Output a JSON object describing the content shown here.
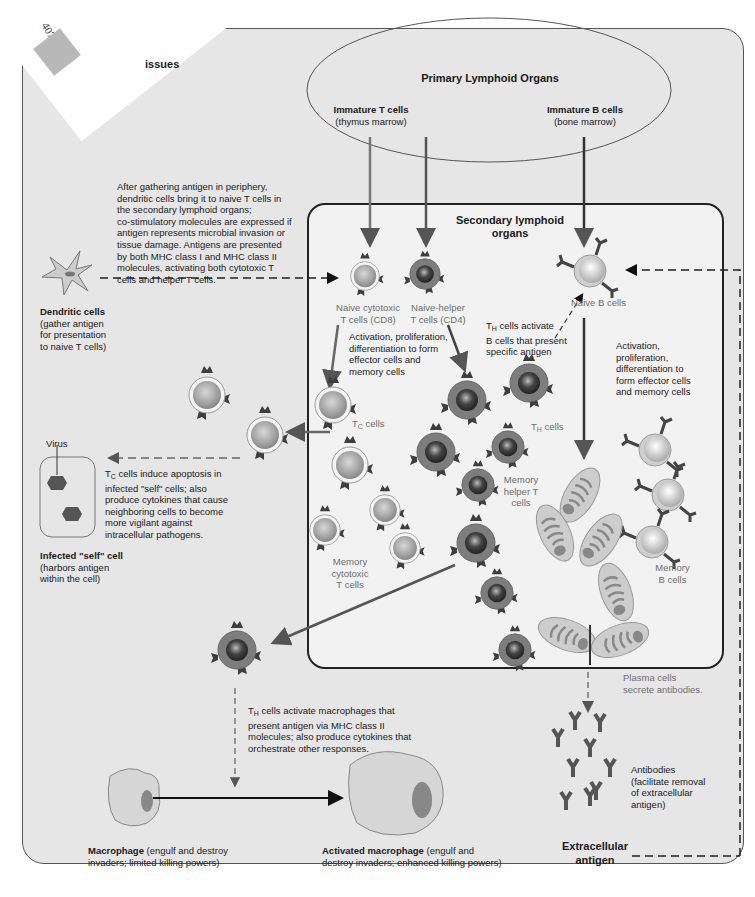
{
  "page": {
    "number": "407",
    "section_title_fragment": "issues"
  },
  "primary_organs": {
    "title": "Primary Lymphoid Organs",
    "immature_t": {
      "title": "Immature T cells",
      "subtitle": "(thymus marrow)"
    },
    "immature_b": {
      "title": "Immature B cells",
      "subtitle": "(bone marrow)"
    }
  },
  "secondary_organs": {
    "title_line1": "Secondary lymphoid",
    "title_line2": "organs"
  },
  "dendritic": {
    "title": "Dendritic cells",
    "desc": [
      "(gather antigen",
      "for presentation",
      "to naive T cells)"
    ],
    "note": [
      "After gathering antigen in periphery,",
      "dendritic cells bring it to naive T cells in",
      "the secondary lymphoid organs;",
      "co-stimulatory molecules are expressed if",
      "antigen represents microbial invasion or",
      "tissue damage. Antigens are presented",
      "by both MHC class I and MHC class II",
      "molecules, activating both cytotoxic T",
      "cells and helper T cells."
    ]
  },
  "naive": {
    "cytotoxic": [
      "Naive cytotoxic",
      "T cells (CD8)"
    ],
    "helper": [
      "Naive-helper",
      "T cells (CD4)"
    ],
    "b": "Naive B cells"
  },
  "activation_t": [
    "Activation, proliferation,",
    "differentiation to form",
    "effector cells and",
    "memory cells"
  ],
  "activation_b": [
    "Activation,",
    "proliferation,",
    "differentiation to",
    "form effector cells",
    "and memory cells"
  ],
  "th_activate_b": {
    "prefix": "T",
    "sub": "H",
    "lines": [
      " cells activate",
      "B cells that present",
      "specific antigen"
    ]
  },
  "tc_cells": {
    "prefix": "T",
    "sub": "C",
    "suffix": " cells"
  },
  "th_cells": {
    "prefix": "T",
    "sub": "H",
    "suffix": " cells"
  },
  "memory_helper": [
    "Memory",
    "helper T",
    "cells"
  ],
  "memory_cytotoxic": [
    "Memory",
    "cytotoxic",
    "T cells"
  ],
  "memory_b": [
    "Memory",
    "B cells"
  ],
  "infected": {
    "virus_label": "Virus",
    "title": "Infected \"self\" cell",
    "desc": [
      "(harbors antigen",
      "within the cell)"
    ]
  },
  "tc_apoptosis": {
    "prefix": "T",
    "sub": "C",
    "lines": [
      " cells induce apoptosis in",
      "infected \"self\" cells; also",
      "produce cytokines that cause",
      "neighboring cells to become",
      "more vigilant against",
      "intracellular pathogens."
    ]
  },
  "th_macrophage": {
    "prefix": "T",
    "sub": "H",
    "lines": [
      " cells activate macrophages that",
      "present antigen via MHC class II",
      "molecules; also produce cytokines that",
      "orchestrate other responses."
    ]
  },
  "plasma": [
    "Plasma cells",
    "secrete antibodies."
  ],
  "antibodies": [
    "Antibodies",
    "(facilitate removal",
    "of extracellular",
    "antigen)"
  ],
  "extracellular": [
    "Extracellular",
    "antigen"
  ],
  "macrophage": {
    "title": "Macrophage",
    "desc_line1": " (engulf and destroy",
    "desc_line2": "invaders; limited killing powers)"
  },
  "activated_macrophage": {
    "title": "Activated macrophage",
    "desc_line1": " (engulf and",
    "desc_line2": "destroy invaders; enhanced killing powers)"
  },
  "colors": {
    "panel_bg": "#e6e6e6",
    "inner_bg": "#f2f2f2",
    "tc_cell": "#9a9a9a",
    "th_cell": "#7d7d7d",
    "b_cell": "#c8c8c8",
    "arrow": "#555555",
    "receptor": "#3d3d3d"
  }
}
